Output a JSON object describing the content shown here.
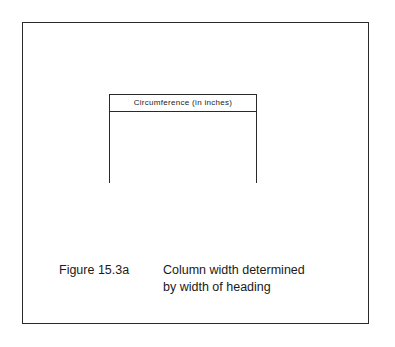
{
  "figure": {
    "table": {
      "header": "Circumference (in inches)"
    },
    "caption": {
      "label": "Figure 15.3a",
      "lines": [
        "Column width determined",
        "by width of heading"
      ]
    }
  }
}
